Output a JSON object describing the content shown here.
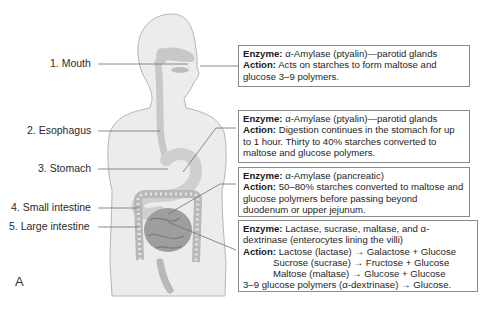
{
  "figure": {
    "panel_label": "A",
    "organs": [
      {
        "num": "1.",
        "name": "Mouth",
        "label": "1. Mouth"
      },
      {
        "num": "2.",
        "name": "Esophagus",
        "label": "2. Esophagus"
      },
      {
        "num": "3.",
        "name": "Stomach",
        "label": "3. Stomach"
      },
      {
        "num": "4.",
        "name": "Small intestine",
        "label": "4. Small intestine"
      },
      {
        "num": "5.",
        "name": "Large intestine",
        "label": "5. Large intestine"
      }
    ],
    "boxes": [
      {
        "enzyme_label": "Enzyme:",
        "enzyme": "α-Amylase (ptyalin)—parotid glands",
        "action_label": "Action:",
        "action": "Acts on starches to form maltose and glucose 3–9 polymers."
      },
      {
        "enzyme_label": "Enzyme:",
        "enzyme": "α-Amylase (ptyalin)—parotid glands",
        "action_label": "Action:",
        "action": "Digestion continues in the stomach for up to 1 hour. Thirty to 40% starches converted to maltose and glucose polymers."
      },
      {
        "enzyme_label": "Enzyme:",
        "enzyme": "α-Amylase (pancreatic)",
        "action_label": "Action:",
        "action": "50–80% starches converted to maltose and glucose polymers before passing beyond duodenum or upper jejunum."
      },
      {
        "enzyme_label": "Enzyme:",
        "enzyme": "Lactase, sucrase, maltase, and α-dextrinase (enterocytes lining the villi)",
        "action_label": "Action:",
        "reactions": [
          "Lactose (lactase) → Galactose + Glucose",
          "Sucrose (sucrase) → Fructose + Glucose",
          "Maltose (maltase) → Glucose + Glucose",
          "3–9 glucose polymers (α-dextrinase) → Glucose."
        ]
      }
    ],
    "colors": {
      "body_fill": "#ececec",
      "body_outline": "#b5b5b5",
      "organ_fill": "#c8c8c8",
      "intestine_fill": "#9e9e9e",
      "leader_line": "#6e6e6e",
      "box_border": "#8a8a8a"
    }
  }
}
